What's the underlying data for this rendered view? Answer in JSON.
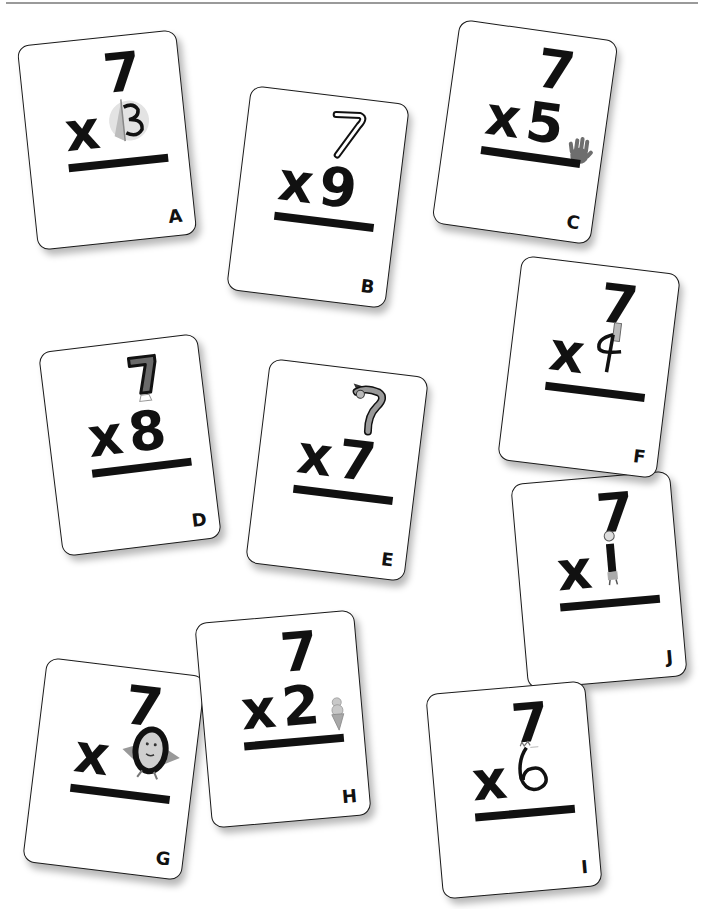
{
  "cards": [
    {
      "id": "A",
      "top": "7",
      "operator": "x",
      "multiplier": "3",
      "letter": "A",
      "decoration": "sailboat-in-circle",
      "problem": "7 x 3"
    },
    {
      "id": "B",
      "top": "7",
      "operator": "x",
      "multiplier": "9",
      "letter": "B",
      "decoration": "boomerang-seven",
      "problem": "7 x 9"
    },
    {
      "id": "C",
      "top": "7",
      "operator": "x",
      "multiplier": "5",
      "letter": "C",
      "decoration": "hand",
      "problem": "7 x 5"
    },
    {
      "id": "D",
      "top": "7",
      "operator": "x",
      "multiplier": "8",
      "letter": "D",
      "decoration": "shaded-seven-with-bell",
      "problem": "7 x 8"
    },
    {
      "id": "E",
      "top": "7",
      "operator": "x",
      "multiplier": "7",
      "letter": "E",
      "decoration": "hatted-seven",
      "problem": "7 x 7"
    },
    {
      "id": "F",
      "top": "7",
      "operator": "x",
      "multiplier": "4",
      "letter": "F",
      "decoration": "four-with-figure",
      "problem": "7 x 4"
    },
    {
      "id": "J",
      "top": "7",
      "operator": "x",
      "multiplier": "1",
      "letter": "J",
      "decoration": "standing-figure-one",
      "problem": "7 x 1"
    },
    {
      "id": "G",
      "top": "7",
      "operator": "x",
      "multiplier": "0",
      "letter": "G",
      "decoration": "egg-hero-zero",
      "problem": "7 x 0"
    },
    {
      "id": "H",
      "top": "7",
      "operator": "x",
      "multiplier": "2",
      "letter": "H",
      "decoration": "ice-cream-cone",
      "problem": "7 x 2"
    },
    {
      "id": "I",
      "top": "7",
      "operator": "x",
      "multiplier": "6",
      "letter": "I",
      "decoration": "cat-six",
      "problem": "7 x 6"
    }
  ],
  "colors": {
    "card_bg": "#ffffff",
    "ink": "#111111",
    "decoration_gray": "#777777",
    "rule_top": "#9a9a9a"
  }
}
